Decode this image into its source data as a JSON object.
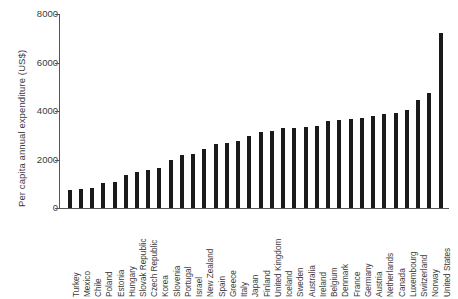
{
  "chart_data": {
    "type": "bar",
    "title": "",
    "xlabel": "",
    "ylabel": "Per capita annual expenditure (US$)",
    "ylim": [
      0,
      8000
    ],
    "ytick_labels": [
      "0",
      "2000",
      "4000",
      "6000",
      "8000"
    ],
    "ytick_values": [
      0,
      2000,
      4000,
      6000,
      8000
    ],
    "grid": false,
    "legend": null,
    "bar_color": "#1a1a1a",
    "categories": [
      "Turkey",
      "Mexico",
      "Chile",
      "Poland",
      "Estonia",
      "Hungary",
      "Slovak Republic",
      "Czech Republic",
      "Korea",
      "Slovenia",
      "Portugal",
      "Israel",
      "New Zealand",
      "Spain",
      "Greece",
      "Italy",
      "Japan",
      "Finland",
      "United Kingdom",
      "Iceland",
      "Sweden",
      "Australia",
      "Ireland",
      "Belgium",
      "Denmark",
      "France",
      "Germany",
      "Austria",
      "Netherlands",
      "Canada",
      "Luxembourg",
      "Switzerland",
      "Norway",
      "United States"
    ],
    "values": [
      730,
      790,
      840,
      1030,
      1060,
      1370,
      1490,
      1570,
      1660,
      1960,
      2180,
      2230,
      2420,
      2620,
      2700,
      2760,
      2990,
      3150,
      3180,
      3320,
      3320,
      3350,
      3380,
      3580,
      3620,
      3660,
      3700,
      3800,
      3890,
      3900,
      4040,
      4450,
      4750,
      7200
    ]
  }
}
